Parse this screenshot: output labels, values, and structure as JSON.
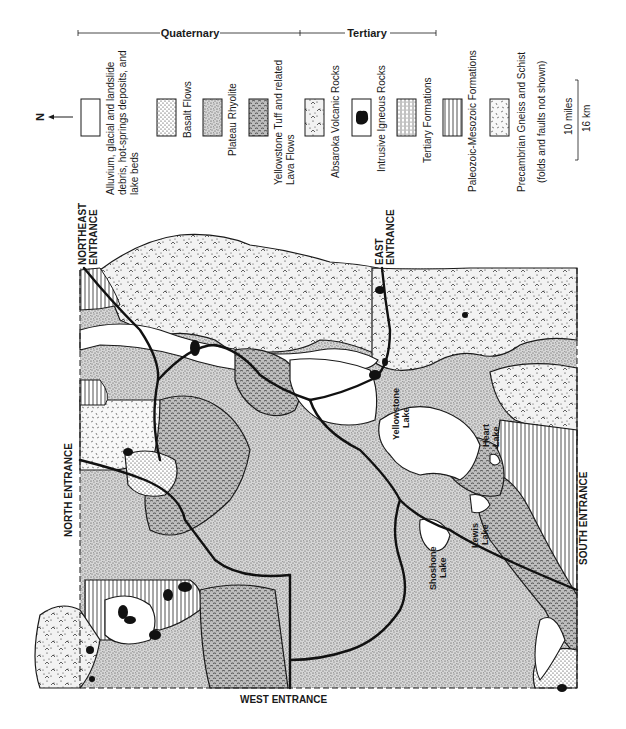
{
  "legend": {
    "north_label": "N",
    "groups": [
      {
        "label": "Quaternary"
      },
      {
        "label": "Tertiary"
      }
    ],
    "items": [
      {
        "key": "alluvium",
        "line1": "Alluvium, glacial and landslide",
        "line2": "debris, hot-springs deposits, and",
        "line3": "lake beds",
        "pattern": "blank"
      },
      {
        "key": "basalt",
        "line1": "Basalt Flows",
        "pattern": "fine-dots"
      },
      {
        "key": "rhyolite",
        "line1": "Plateau Rhyolite",
        "pattern": "dense-stipple"
      },
      {
        "key": "tuff",
        "line1": "Yellowstone Tuff and related",
        "line2": "Lava Flows",
        "pattern": "wavy-dash"
      },
      {
        "key": "absaroka",
        "line1": "Absaroka Volcanic Rocks",
        "pattern": "dots-chevrons"
      },
      {
        "key": "intrusive",
        "line1": "Intrusive Igneous Rocks",
        "pattern": "solid-black-blob"
      },
      {
        "key": "tertiary",
        "line1": "Tertiary Formations",
        "pattern": "dotted-vertical-lines"
      },
      {
        "key": "paleozoic",
        "line1": "Paleozoic-Mesozoic Formations",
        "pattern": "vertical-lines"
      },
      {
        "key": "precambrian",
        "line1": "Precambrian Gneiss and Schist",
        "line2": "(folds and faults not shown)",
        "pattern": "scattered-dashes"
      }
    ],
    "scale": {
      "miles": "10 miles",
      "km": "16 km"
    }
  },
  "map": {
    "entrances": {
      "northeast_line1": "NORTHEAST",
      "northeast_line2": "ENTRANCE",
      "north": "NORTH ENTRANCE",
      "east_line1": "EAST",
      "east_line2": "ENTRANCE",
      "west": "WEST ENTRANCE",
      "south": "SOUTH ENTRANCE"
    },
    "lakes": {
      "yellowstone_1": "Yellowstone",
      "yellowstone_2": "Lake",
      "heart_1": "Heart",
      "heart_2": "Lake",
      "lewis_1": "Lewis",
      "lewis_2": "Lake",
      "shoshone_1": "Shoshone",
      "shoshone_2": "Lake"
    }
  },
  "colors": {
    "ink": "#1a1a1a",
    "paper": "#ffffff"
  }
}
